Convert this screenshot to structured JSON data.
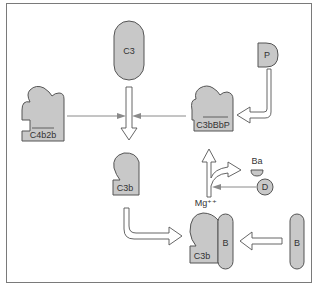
{
  "diagram": {
    "colors": {
      "shape_fill": "#c8c8c8",
      "shape_stroke": "#555555",
      "frame": "#7a7a7a",
      "background": "#ffffff"
    },
    "nodes": {
      "c3": {
        "label": "C3",
        "shape": "capsule"
      },
      "c4b2b": {
        "label": "C4b2b",
        "shape": "mitt",
        "overline": true
      },
      "c3bbbp": {
        "label": "C3bBbP",
        "shape": "mitt",
        "overline": true
      },
      "p": {
        "label": "P",
        "shape": "half-capsule"
      },
      "c3b": {
        "label": "C3b",
        "shape": "mitt"
      },
      "ba": {
        "label": "Ba",
        "shape": "half-circle"
      },
      "d": {
        "label": "D",
        "shape": "circle"
      },
      "mg": {
        "label": "Mg⁺⁺"
      },
      "complex_c3b": {
        "label": "C3b",
        "shape": "mitt"
      },
      "complex_b": {
        "label": "B",
        "shape": "capsule"
      },
      "b": {
        "label": "B",
        "shape": "capsule"
      }
    },
    "edges": [
      {
        "from": "C3",
        "to": "C3b",
        "style": "hollow-arrow"
      },
      {
        "from": "C4b2b",
        "to": "C3→C3b",
        "style": "thin-arrow"
      },
      {
        "from": "C3bBbP",
        "to": "C3→C3b",
        "style": "thin-arrow"
      },
      {
        "from": "P",
        "to": "C3bBbP",
        "style": "hollow-arrow-elbow"
      },
      {
        "from": "C3b",
        "to": "C3bB",
        "style": "hollow-arrow-elbow"
      },
      {
        "from": "B",
        "to": "C3bB",
        "style": "hollow-arrow"
      },
      {
        "from": "C3bB",
        "to": "C3bBbP",
        "style": "hollow-arrow"
      },
      {
        "from": "C3bB",
        "to": "Ba",
        "style": "hollow-arrow-branch"
      },
      {
        "from": "D",
        "to": "C3bB→C3bBbP",
        "style": "thin-arrow"
      }
    ]
  }
}
